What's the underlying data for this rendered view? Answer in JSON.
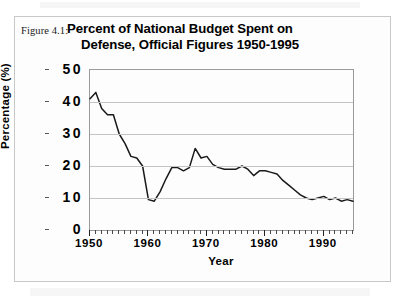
{
  "figure": {
    "number_label": "Figure 4.1:",
    "title_line_1": "Percent of National Budget Spent on",
    "title_line_2": "Defense, Official Figures 1950-1995"
  },
  "chart_data": {
    "type": "line",
    "title": "Percent of National Budget Spent on Defense, Official Figures 1950-1995",
    "xlabel": "Year",
    "ylabel": "Percentage (%)",
    "xlim": [
      1950,
      1995
    ],
    "ylim": [
      0,
      50
    ],
    "ytick_labels": [
      "50",
      "40",
      "30",
      "20",
      "10",
      "0"
    ],
    "ytick_values": [
      50,
      40,
      30,
      20,
      10,
      0
    ],
    "xtick_labels": [
      "1950",
      "1960",
      "1970",
      "1980",
      "1990"
    ],
    "xtick_values": [
      1950,
      1960,
      1970,
      1980,
      1990
    ],
    "xtick_minor_interval": 1,
    "grid": "horizontal",
    "legend": "none",
    "line_color": "#1a1a1a",
    "x": [
      1950,
      1951,
      1952,
      1953,
      1954,
      1955,
      1956,
      1957,
      1958,
      1959,
      1960,
      1961,
      1962,
      1963,
      1964,
      1965,
      1966,
      1967,
      1968,
      1969,
      1970,
      1971,
      1972,
      1973,
      1974,
      1975,
      1976,
      1977,
      1978,
      1979,
      1980,
      1981,
      1982,
      1983,
      1984,
      1985,
      1986,
      1987,
      1988,
      1989,
      1990,
      1991,
      1992,
      1993,
      1994,
      1995
    ],
    "values": [
      41,
      43,
      38,
      36,
      36,
      30,
      27,
      23,
      22.5,
      20,
      9.5,
      9,
      12,
      16,
      19.5,
      19.5,
      18.5,
      19.5,
      25.5,
      22.5,
      23,
      20.5,
      19.5,
      19,
      19,
      19,
      20,
      19,
      17,
      18.5,
      18.5,
      18,
      17.5,
      15.5,
      14,
      12.5,
      11,
      10,
      9.5,
      10,
      10.5,
      9.5,
      10,
      9,
      9.5,
      9
    ]
  }
}
